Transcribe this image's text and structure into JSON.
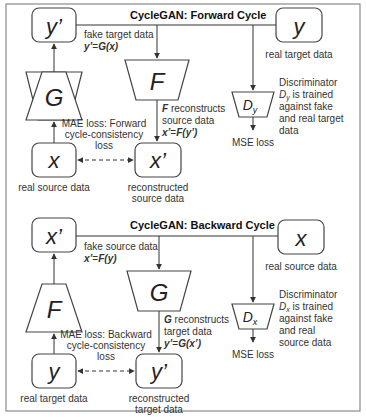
{
  "forward": {
    "title": "CycleGAN: Forward Cycle",
    "nodes": {
      "y_prime": "y’",
      "G": "G",
      "x": "x",
      "F": "F",
      "x_prime": "x’",
      "y": "y",
      "D": "D",
      "D_sub": "y"
    },
    "labels": {
      "fake_line1": "fake target data",
      "fake_formula_lhs": "y’",
      "fake_formula_eq": "=",
      "fake_formula_rhs": "G(x)",
      "F_recon_bold": "F",
      "F_recon_rest": " reconstructs",
      "F_recon_line2": "source data",
      "F_formula_lhs": "x’",
      "F_formula_eq": "=",
      "F_formula_rhs": "F(y’)",
      "mae_line1": "MAE loss: Forward",
      "mae_line2": "cycle-consistency",
      "mae_line3": "loss",
      "real_source": "real source data",
      "recon_line1": "reconstructed",
      "recon_line2": "source data",
      "real_target": "real target data",
      "disc_line1": "Discriminator",
      "disc_line2_sym": "D",
      "disc_line2_sub": "y",
      "disc_line2_rest": " is trained",
      "disc_line3": "against fake",
      "disc_line4": "and real target",
      "disc_line5": "data",
      "mse": "MSE loss"
    }
  },
  "backward": {
    "title": "CycleGAN: Backward Cycle",
    "nodes": {
      "x_prime": "x’",
      "F": "F",
      "y": "y",
      "G": "G",
      "y_prime": "y’",
      "x": "x",
      "D": "D",
      "D_sub": "x"
    },
    "labels": {
      "fake_line1": "fake source data",
      "fake_formula_lhs": "x’",
      "fake_formula_eq": "=",
      "fake_formula_rhs": "F(y)",
      "G_recon_bold": "G",
      "G_recon_rest": " reconstructs",
      "G_recon_line2": "target data",
      "G_formula_lhs": "y’",
      "G_formula_eq": "=",
      "G_formula_rhs": "G(x’)",
      "mae_line1": "MAE loss: Backward",
      "mae_line2": "cycle-consistency",
      "mae_line3": "loss",
      "real_target": "real target data",
      "recon_line1": "reconstructed",
      "recon_line2": "target data",
      "real_source": "real source data",
      "disc_line1": "Discriminator",
      "disc_line2_sym": "D",
      "disc_line2_sub": "x",
      "disc_line2_rest": " is trained",
      "disc_line3": "against fake",
      "disc_line4": "and real",
      "disc_line5": "source data",
      "mse": "MSE loss"
    }
  },
  "colors": {
    "stroke": "#444444",
    "frame": "#8a8a8a",
    "text": "#333333",
    "background": "#ffffff"
  }
}
